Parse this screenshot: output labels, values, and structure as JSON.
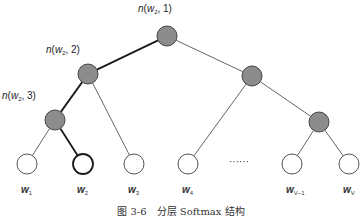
{
  "diagram": {
    "title": "分层 Softmax 结构",
    "caption": "图 3-6　分层 Softmax 结构",
    "colors": {
      "inner_node_fill": "#8c8c8c",
      "inner_node_stroke": "#444444",
      "leaf_fill": "#ffffff",
      "leaf_stroke": "#555555",
      "highlight_stroke": "#1a1a1a",
      "edge": "#555555",
      "highlight_edge": "#1a1a1a"
    },
    "inner_nodes": [
      {
        "id": "root",
        "x": 167,
        "y": 36,
        "label_var": "n(",
        "label_w": "w",
        "label_sub": "2",
        "label_idx": ", 1)",
        "lx": 138,
        "ly": 3
      },
      {
        "id": "n2",
        "x": 88,
        "y": 74,
        "label_var": "n(",
        "label_w": "w",
        "label_sub": "2",
        "label_idx": ", 2)",
        "lx": 46,
        "ly": 44
      },
      {
        "id": "n3",
        "x": 55,
        "y": 120,
        "label_var": "n(",
        "label_w": "w",
        "label_sub": "2",
        "label_idx": ", 3)",
        "lx": 2,
        "ly": 90
      },
      {
        "id": "r1",
        "x": 252,
        "y": 76
      },
      {
        "id": "r2",
        "x": 319,
        "y": 122
      }
    ],
    "leaves": [
      {
        "id": "w1",
        "x": 27,
        "y": 164,
        "name": "w",
        "sub": "1",
        "highlight": false
      },
      {
        "id": "w2",
        "x": 83,
        "y": 164,
        "name": "w",
        "sub": "2",
        "highlight": true
      },
      {
        "id": "w3",
        "x": 134,
        "y": 164,
        "name": "w",
        "sub": "3",
        "highlight": false
      },
      {
        "id": "w4",
        "x": 188,
        "y": 164,
        "name": "w",
        "sub": "4",
        "highlight": false
      },
      {
        "id": "wV-1",
        "x": 292,
        "y": 164,
        "name": "w",
        "sub": "V−1",
        "highlight": false
      },
      {
        "id": "wV",
        "x": 349,
        "y": 164,
        "name": "w",
        "sub": "V",
        "highlight": false
      }
    ],
    "edges": [
      {
        "from": "root",
        "to": "n2",
        "highlight": true
      },
      {
        "from": "root",
        "to": "r1",
        "highlight": false
      },
      {
        "from": "n2",
        "to": "n3",
        "highlight": true
      },
      {
        "from": "n2",
        "to": "w3",
        "highlight": false
      },
      {
        "from": "n3",
        "to": "w1",
        "highlight": false
      },
      {
        "from": "n3",
        "to": "w2",
        "highlight": true
      },
      {
        "from": "r1",
        "to": "w4",
        "highlight": false
      },
      {
        "from": "r1",
        "to": "r2",
        "highlight": false
      },
      {
        "from": "r2",
        "to": "wV-1",
        "highlight": false
      },
      {
        "from": "r2",
        "to": "wV",
        "highlight": false
      }
    ],
    "ellipsis": "······",
    "ellipsis_pos": {
      "x": 229,
      "y": 156
    },
    "node_radius": 10
  }
}
